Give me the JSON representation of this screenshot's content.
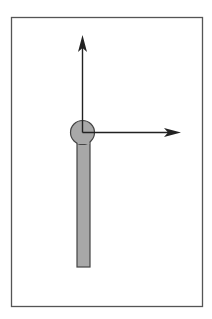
{
  "diagram": {
    "type": "coordinate-frame-on-link",
    "colors": {
      "background": "#ffffff",
      "frame_border": "#555555",
      "link_fill": "#a8a8a8",
      "link_stroke": "#444444",
      "axis": "#222222"
    },
    "elements": {
      "frame": {
        "label": ""
      },
      "link_bar": {
        "label": ""
      },
      "joint_circle": {
        "label": ""
      },
      "y_axis_arrow": {
        "label": ""
      },
      "x_axis_arrow": {
        "label": ""
      }
    }
  }
}
